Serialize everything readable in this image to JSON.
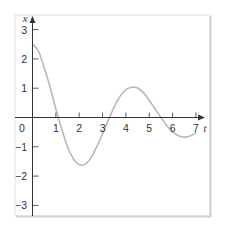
{
  "chart_data": {
    "type": "line",
    "title": "",
    "xlabel": "t",
    "ylabel": "x",
    "xlim": [
      0,
      7.4
    ],
    "ylim": [
      -3.3,
      3.4
    ],
    "grid": false,
    "legend": null,
    "x_ticks": [
      1,
      2,
      3,
      4,
      5,
      6,
      7
    ],
    "x_tick_labels": [
      "0",
      "1",
      "2",
      "3",
      "4",
      "5",
      "6",
      "7"
    ],
    "y_ticks": [
      3,
      2,
      1,
      -1,
      -2,
      -3
    ],
    "y_tick_labels": [
      "3",
      "2",
      "1",
      "−1",
      "−2",
      "−3"
    ],
    "series": [
      {
        "name": "x(t)",
        "color": "#b8b8b8",
        "x": [
          0,
          0.25,
          0.5,
          0.75,
          1,
          1.25,
          1.5,
          1.75,
          2,
          2.25,
          2.5,
          2.75,
          3,
          3.25,
          3.5,
          3.75,
          4,
          4.25,
          4.5,
          4.75,
          5,
          5.25,
          5.5,
          5.75,
          6,
          6.25,
          6.5,
          6.75,
          7
        ],
        "values": [
          2.5,
          2.27,
          1.71,
          1.05,
          0.29,
          -0.39,
          -1.0,
          -1.41,
          -1.61,
          -1.6,
          -1.38,
          -1.0,
          -0.56,
          -0.09,
          0.36,
          0.72,
          0.95,
          1.03,
          1.01,
          0.85,
          0.58,
          0.29,
          0.0,
          -0.27,
          -0.49,
          -0.62,
          -0.67,
          -0.63,
          -0.52
        ]
      }
    ]
  },
  "axes": {
    "x_label": "t",
    "y_label": "x",
    "origin_label": "0"
  },
  "colors": {
    "axis": "#333333",
    "curve": "#b8b8b8",
    "frame": "#d9d9d9",
    "frame_shadow": "#cfcfcf"
  }
}
